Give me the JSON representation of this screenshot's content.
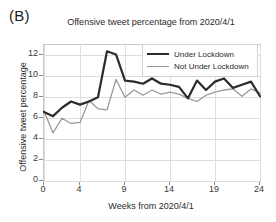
{
  "panel": {
    "label": "(B)"
  },
  "chart_data": {
    "type": "line",
    "title": "Offensive tweet percentage from 2020/4/1",
    "xlabel": "Weeks from 2020/4/1",
    "ylabel": "Offensive tweet percentage",
    "xlim": [
      0,
      24
    ],
    "ylim": [
      0,
      13
    ],
    "xticks": [
      0,
      4,
      9,
      14,
      19,
      24
    ],
    "yticks": [
      0,
      2,
      4,
      6,
      8,
      10,
      12
    ],
    "grid": true,
    "legend_position": "top right",
    "x": [
      0,
      1,
      2,
      3,
      4,
      5,
      6,
      7,
      8,
      9,
      10,
      11,
      12,
      13,
      14,
      15,
      16,
      17,
      18,
      19,
      20,
      21,
      22,
      23,
      24
    ],
    "series": [
      {
        "name": "Under Lockdown",
        "color": "#2b2b2b",
        "values": [
          6.6,
          6.2,
          7.0,
          7.6,
          7.3,
          7.6,
          8.0,
          12.4,
          12.1,
          9.6,
          9.5,
          9.3,
          9.8,
          9.3,
          9.2,
          9.0,
          7.9,
          9.6,
          8.7,
          9.5,
          9.8,
          8.9,
          9.2,
          9.5,
          8.1
        ]
      },
      {
        "name": "Not Under Lockdown",
        "color": "#9a9a9a",
        "values": [
          6.7,
          4.6,
          6.0,
          5.5,
          5.6,
          7.7,
          6.9,
          6.8,
          9.7,
          8.0,
          8.7,
          8.2,
          8.7,
          8.3,
          8.5,
          8.3,
          7.9,
          7.6,
          8.2,
          8.5,
          8.7,
          8.8,
          8.1,
          8.8,
          8.4
        ]
      }
    ]
  }
}
